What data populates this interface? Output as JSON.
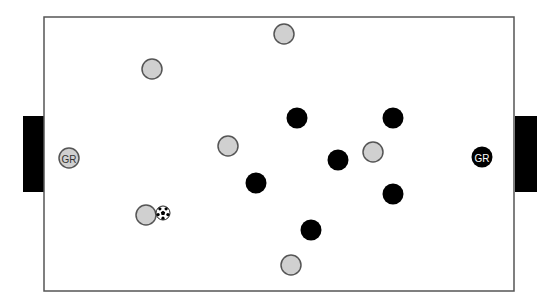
{
  "field": {
    "x": 44,
    "y": 17,
    "width": 470,
    "height": 274,
    "border_color": "#555555",
    "fill": "#ffffff"
  },
  "goals": [
    {
      "side": "left",
      "x": 23,
      "y": 116,
      "width": 21,
      "height": 76,
      "color": "#000000"
    },
    {
      "side": "right",
      "x": 515,
      "y": 116,
      "width": 22,
      "height": 76,
      "color": "#000000"
    }
  ],
  "colors": {
    "team_light_fill": "#d0d0d0",
    "team_light_stroke": "#555555",
    "team_dark_fill": "#000000",
    "label_light": "#333333",
    "label_dark": "#ffffff"
  },
  "team_light": {
    "goalkeeper": {
      "x": 69,
      "y": 158,
      "label": "GR"
    },
    "players": [
      {
        "x": 284,
        "y": 34
      },
      {
        "x": 152,
        "y": 69
      },
      {
        "x": 228,
        "y": 146
      },
      {
        "x": 373,
        "y": 152
      },
      {
        "x": 146,
        "y": 215
      },
      {
        "x": 291,
        "y": 265
      }
    ]
  },
  "team_dark": {
    "goalkeeper": {
      "x": 482,
      "y": 157,
      "label": "GR"
    },
    "players": [
      {
        "x": 297,
        "y": 118
      },
      {
        "x": 393,
        "y": 118
      },
      {
        "x": 338,
        "y": 160
      },
      {
        "x": 256,
        "y": 183
      },
      {
        "x": 393,
        "y": 194
      },
      {
        "x": 311,
        "y": 230
      }
    ]
  },
  "ball": {
    "x": 163,
    "y": 213,
    "r": 7
  }
}
